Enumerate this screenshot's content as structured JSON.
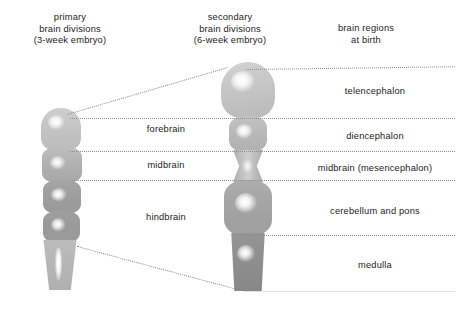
{
  "columns": {
    "primary": {
      "line1": "primary",
      "line2": "brain divisions",
      "line3": "(3-week embryo)"
    },
    "secondary": {
      "line1": "secondary",
      "line2": "brain divisions",
      "line3": "(6-week embryo)"
    },
    "birth": {
      "line1": "brain regions",
      "line2": "at birth"
    }
  },
  "primary_divisions": [
    {
      "label": "forebrain",
      "top": 124
    },
    {
      "label": "midbrain",
      "top": 160
    },
    {
      "label": "hindbrain",
      "top": 212
    }
  ],
  "brain_regions": [
    {
      "label": "telencephalon",
      "top": 86
    },
    {
      "label": "diencephalon",
      "top": 131
    },
    {
      "label": "midbrain (mesencephalon)",
      "top": 163
    },
    {
      "label": "cerebellum and pons",
      "top": 206
    },
    {
      "label": "medulla",
      "top": 260
    }
  ],
  "dividers": [
    {
      "name": "top-telencephalon-line",
      "left": 246,
      "top": 66,
      "width": 209,
      "slant": -0.7
    },
    {
      "name": "telencephalon-diencephalon-line",
      "left": 70,
      "top": 118,
      "width": 385
    },
    {
      "name": "diencephalon-midbrain-line",
      "left": 70,
      "top": 151,
      "width": 385
    },
    {
      "name": "midbrain-hindbrain-line",
      "left": 70,
      "top": 180,
      "width": 385
    },
    {
      "name": "cerebellum-medulla-line",
      "left": 245,
      "top": 235,
      "width": 210
    }
  ],
  "connectors": [
    {
      "name": "upper-diagonal-connector",
      "x1": 67,
      "y1": 114,
      "x2": 228,
      "y2": 67
    },
    {
      "name": "lower-diagonal-connector",
      "x1": 77,
      "y1": 246,
      "x2": 241,
      "y2": 290
    }
  ],
  "colors": {
    "text": "#1b1b1b",
    "divider": "#8e8e8e",
    "connector": "#8a8a8a",
    "baseline": "#e2e2e2",
    "segment_light": "#c3c3c3",
    "segment_mid": "#b0b0b0",
    "segment_dark": "#9a9a9a",
    "segment_darker": "#8b8b8b",
    "highlight": "#ffffff"
  },
  "primary_brain": {
    "name": "3-week embryo neural tube",
    "segments": [
      {
        "name": "forebrain-segment",
        "shade": "#c3c3c3"
      },
      {
        "name": "midbrain-segment",
        "shade": "#b2b2b2"
      },
      {
        "name": "hindbrain-upper-segment",
        "shade": "#a0a0a0"
      },
      {
        "name": "hindbrain-lower-segment",
        "shade": "#9c9c9c"
      },
      {
        "name": "spinal-cord-segment",
        "shade": "#b6b6b6"
      }
    ]
  },
  "secondary_brain": {
    "name": "6-week embryo brain",
    "segments": [
      {
        "name": "telencephalon-segment",
        "shade": "#c4c4c4"
      },
      {
        "name": "diencephalon-segment",
        "shade": "#b8b8b8"
      },
      {
        "name": "mesencephalon-segment",
        "shade": "#b4b4b4"
      },
      {
        "name": "cerebellum-pons-segment",
        "shade": "#a6a6a6"
      },
      {
        "name": "medulla-segment",
        "shade": "#909090"
      }
    ]
  }
}
